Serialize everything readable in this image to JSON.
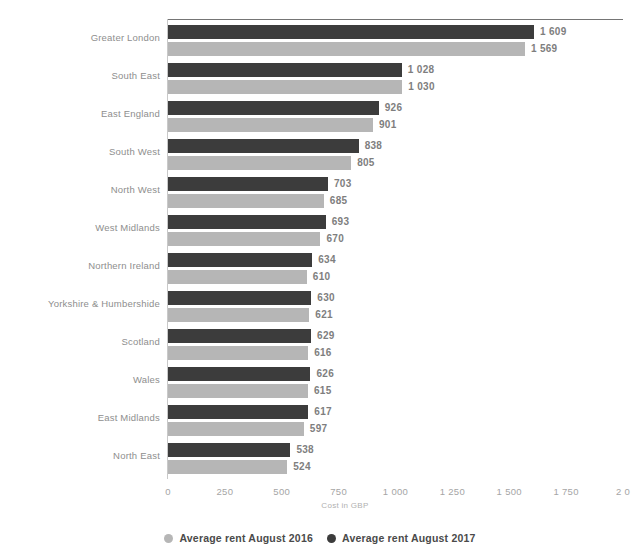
{
  "chart_data": {
    "type": "bar",
    "orientation": "horizontal",
    "title": "",
    "xlabel": "Cost in GBP",
    "ylabel": "",
    "xlim": [
      0,
      2000
    ],
    "grid": false,
    "legend_position": "bottom",
    "xticks": [
      "0",
      "250",
      "500",
      "750",
      "1 000",
      "1 250",
      "1 500",
      "1 750",
      "2 0"
    ],
    "xtick_values": [
      0,
      250,
      500,
      750,
      1000,
      1250,
      1500,
      1750,
      2000
    ],
    "categories": [
      "Greater London",
      "South East",
      "East England",
      "South West",
      "North West",
      "West Midlands",
      "Northern Ireland",
      "Yorkshire & Humbershide",
      "Scotland",
      "Wales",
      "East Midlands",
      "North East"
    ],
    "series": [
      {
        "name": "Average rent August 2017",
        "color": "#3c3c3c",
        "values": [
          1609,
          1028,
          926,
          838,
          703,
          693,
          634,
          630,
          629,
          626,
          617,
          538
        ],
        "labels": [
          "1 609",
          "1 028",
          "926",
          "838",
          "703",
          "693",
          "634",
          "630",
          "629",
          "626",
          "617",
          "538"
        ]
      },
      {
        "name": "Average rent August 2016",
        "color": "#b6b6b6",
        "values": [
          1569,
          1030,
          901,
          805,
          685,
          670,
          610,
          621,
          616,
          615,
          597,
          524
        ],
        "labels": [
          "1 569",
          "1 030",
          "901",
          "805",
          "685",
          "670",
          "610",
          "621",
          "616",
          "615",
          "597",
          "524"
        ]
      }
    ]
  },
  "legend": {
    "items": [
      {
        "label": "Average rent August 2016",
        "color": "#b6b6b6"
      },
      {
        "label": "Average rent August 2017",
        "color": "#3c3c3c"
      }
    ]
  }
}
